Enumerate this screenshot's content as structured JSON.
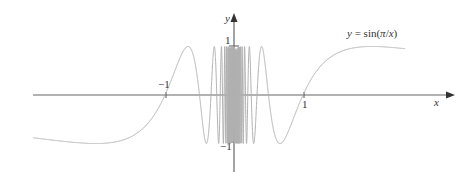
{
  "chart_data": {
    "type": "line",
    "title": "",
    "function": "y = sin(π/x)",
    "series": [
      {
        "name": "y = sin(π/x)",
        "expression": "sin(pi/x)",
        "x_range": [
          -2.91,
          2.48
        ],
        "color": "#b0b0b0"
      }
    ],
    "xlabel": "x",
    "ylabel": "y",
    "x_ticks": [
      {
        "value": -1,
        "label": "−1"
      },
      {
        "value": 1,
        "label": "1"
      }
    ],
    "y_ticks": [
      {
        "value": 1,
        "label": "1"
      },
      {
        "value": -1,
        "label": "−1"
      }
    ],
    "xlim": [
      -2.91,
      3.2
    ],
    "ylim": [
      -1.1,
      1.1
    ],
    "grid": false,
    "legend": "none",
    "annotations": [
      {
        "text": "y = sin(π/x)",
        "position": "upper-right"
      }
    ]
  },
  "labels": {
    "x_axis": "x",
    "y_axis": "y",
    "tick_neg1_x": "−1",
    "tick_pos1_x": "1",
    "tick_pos1_y": "1",
    "tick_neg1_y": "−1",
    "curve_label_y": "y",
    "curve_label_eq": " = sin(",
    "curve_label_pi": "π",
    "curve_label_slash": "/",
    "curve_label_x": "x",
    "curve_label_close": ")"
  },
  "layout": {
    "origin_x": 234,
    "origin_y": 95,
    "unit_x": 69,
    "unit_y": 48.5,
    "curve_color": "#b0b0b0",
    "axis_color": "#555555"
  }
}
